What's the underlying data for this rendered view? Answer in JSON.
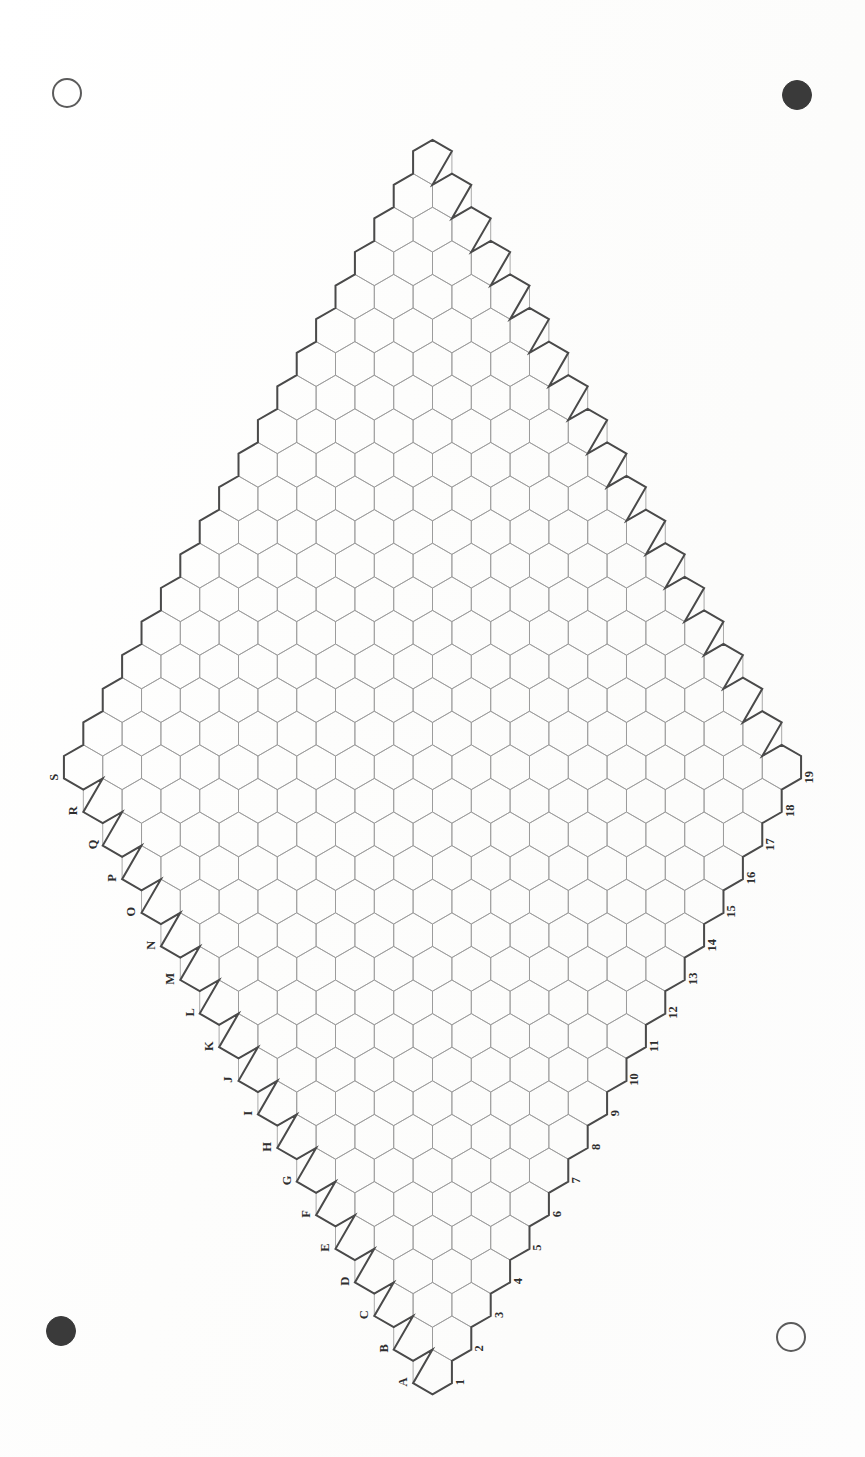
{
  "document": {
    "type": "scanned-hex-game-board",
    "title": "Hex board - 19x19 rhombus",
    "background_color": "#fdfdfd",
    "page_width": 865,
    "page_height": 1457,
    "orientation_note": "board and labels rotated 90 degrees on the page"
  },
  "registration_marks": [
    {
      "name": "top-left",
      "style": "open",
      "cx": 67,
      "cy": 93,
      "r": 15,
      "color": "#5b5b5b"
    },
    {
      "name": "top-right",
      "style": "filled",
      "cx": 797,
      "cy": 95,
      "r": 15,
      "color": "#3a3a3a"
    },
    {
      "name": "bottom-left",
      "style": "filled",
      "cx": 61,
      "cy": 1331,
      "r": 15,
      "color": "#3a3a3a"
    },
    {
      "name": "bottom-right",
      "style": "open",
      "cx": 791,
      "cy": 1337,
      "r": 15,
      "color": "#5b5b5b"
    }
  ],
  "board": {
    "shape": "rhombus",
    "size": 19,
    "rows": 19,
    "columns": 19,
    "total_cells": 361,
    "cell_orientation": "pointy-top",
    "hex_width": 38,
    "hex_height": 44,
    "grid_line_color": "#9a9a9a",
    "border_line_color": "#4a4a4a",
    "apex_cell": "A1",
    "apex_position": "bottom",
    "far_vertex_position": "top"
  },
  "labels": {
    "letter_axis": {
      "name": "letters",
      "edge": "lower-left",
      "direction": "from bottom vertex upward-left",
      "note": "letter I is skipped between H and J",
      "items": [
        "A",
        "B",
        "C",
        "D",
        "E",
        "F",
        "G",
        "H",
        "I",
        "J",
        "K",
        "L",
        "M",
        "N",
        "O",
        "P",
        "Q",
        "R",
        "S"
      ]
    },
    "number_axis": {
      "name": "numbers",
      "edge": "lower-right",
      "direction": "from bottom vertex upward-right",
      "items": [
        "1",
        "2",
        "3",
        "4",
        "5",
        "6",
        "7",
        "8",
        "9",
        "10",
        "11",
        "12",
        "13",
        "14",
        "15",
        "16",
        "17",
        "18",
        "19"
      ]
    }
  },
  "colors": {
    "paper": "#fdfdfd",
    "ink_light": "#9a9a9a",
    "ink_dark": "#4a4a4a",
    "label_ink": "#2e2e2e",
    "mark_open": "#5b5b5b",
    "mark_filled": "#3a3a3a"
  }
}
